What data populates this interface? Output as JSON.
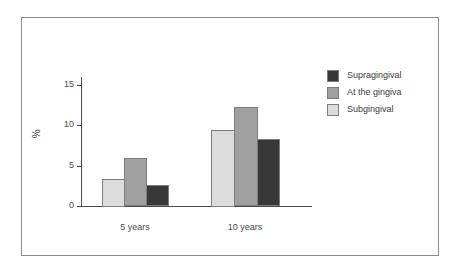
{
  "chart_data": {
    "type": "bar",
    "title": "",
    "xlabel": "",
    "ylabel": "%",
    "categories": [
      "5 years",
      "10 years"
    ],
    "series": [
      {
        "name": "Subgingival",
        "color": "#dcdcdc",
        "values": [
          3.4,
          9.5
        ]
      },
      {
        "name": "At the gingiva",
        "color": "#a0a0a0",
        "values": [
          6.0,
          12.3
        ]
      },
      {
        "name": "Supragingival",
        "color": "#383838",
        "values": [
          2.7,
          8.3
        ]
      }
    ],
    "legend_order": [
      "Supragingival",
      "At the gingiva",
      "Subgingival"
    ],
    "ylim": [
      0,
      15
    ],
    "yticks": [
      0,
      5,
      10,
      15
    ],
    "ytick_labels": [
      "0",
      "5",
      "10",
      "15"
    ],
    "grid": false,
    "legend_position": "upper right"
  },
  "axis": {
    "ylabel": "%",
    "tick_0": "0",
    "tick_5": "5",
    "tick_10": "10",
    "tick_15": "15",
    "cat_0": "5 years",
    "cat_1": "10 years"
  },
  "legend": {
    "item_0": "Supragingival",
    "item_1": "At the gingiva",
    "item_2": "Subgingival"
  },
  "colors": {
    "supragingival": "#383838",
    "at_the_gingiva": "#a0a0a0",
    "subgingival": "#dcdcdc",
    "axis": "#4a4a4a",
    "frame": "#8c8c8c",
    "bar_outline": "#7d7d7d"
  }
}
